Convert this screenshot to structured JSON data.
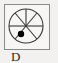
{
  "figure": {
    "caption": "D",
    "panel": {
      "border_color": "#8b8b8b",
      "fill_color": "#f7f6f4"
    },
    "background_color": "#f2f1ef",
    "stroke_color": "#3a3a3a",
    "marker_color": "#000000"
  },
  "chart_data": {
    "type": "pie",
    "title": "D",
    "xlabel": "",
    "ylabel": "",
    "circle": {
      "center_x": 26,
      "center_y": 26,
      "radius": 17
    },
    "spoke_count": 7,
    "spoke_angles_deg": [
      0,
      50,
      90,
      130,
      180,
      230,
      310
    ],
    "categories": [
      "s1",
      "s2",
      "s3",
      "s4",
      "s5",
      "s6",
      "s7"
    ],
    "values": [
      1,
      1,
      1,
      1,
      1,
      1,
      1
    ],
    "marker": {
      "label": "dot",
      "center_x": 21,
      "center_y": 34,
      "radius": 3.2,
      "color": "#000000"
    },
    "legend": [],
    "grid": false
  }
}
